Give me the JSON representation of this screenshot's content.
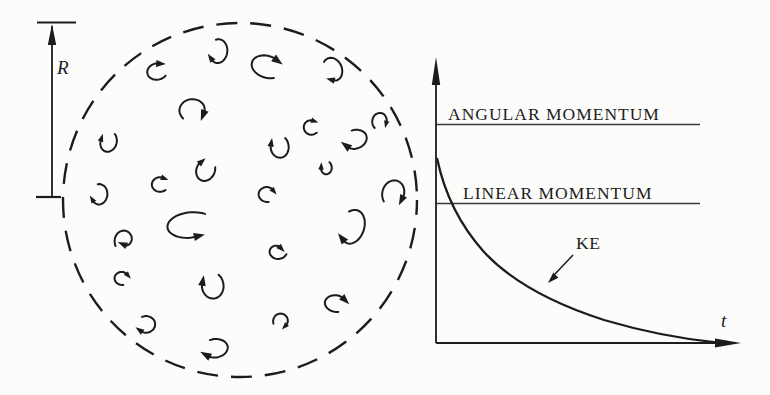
{
  "colors": {
    "ink": "#1c1c1c",
    "line": "#3a3a3a",
    "bg": "#fcfcfb"
  },
  "turbulence_panel": {
    "radius_label": "R",
    "circle": {
      "cx": 240,
      "cy": 200,
      "r": 177
    },
    "eddies": [
      {
        "x": 157,
        "y": 71,
        "rx": 11,
        "ry": 9,
        "rot": -15,
        "a0": -310,
        "a1": -60
      },
      {
        "x": 218,
        "y": 52,
        "rx": 10,
        "ry": 13,
        "rot": 10,
        "a0": -115,
        "a1": 135
      },
      {
        "x": 267,
        "y": 66,
        "rx": 17,
        "ry": 12,
        "rot": 15,
        "a0": -305,
        "a1": -55
      },
      {
        "x": 333,
        "y": 70,
        "rx": 10,
        "ry": 13,
        "rot": -20,
        "a0": -125,
        "a1": 125
      },
      {
        "x": 193,
        "y": 110,
        "rx": 14,
        "ry": 12,
        "rot": 0,
        "a0": -225,
        "a1": 25
      },
      {
        "x": 311,
        "y": 127,
        "rx": 8,
        "ry": 8,
        "rot": 0,
        "a0": -315,
        "a1": -65
      },
      {
        "x": 380,
        "y": 121,
        "rx": 8,
        "ry": 9,
        "rot": 10,
        "a0": -240,
        "a1": 10
      },
      {
        "x": 108,
        "y": 142,
        "rx": 9,
        "ry": 11,
        "rot": 15,
        "a0": -60,
        "a1": 190
      },
      {
        "x": 279,
        "y": 147,
        "rx": 10,
        "ry": 12,
        "rot": -10,
        "a0": -40,
        "a1": 210
      },
      {
        "x": 355,
        "y": 140,
        "rx": 13,
        "ry": 10,
        "rot": -20,
        "a0": -90,
        "a1": 160
      },
      {
        "x": 326,
        "y": 168,
        "rx": 6,
        "ry": 7,
        "rot": 0,
        "a0": -55,
        "a1": 190
      },
      {
        "x": 205,
        "y": 170,
        "rx": 10,
        "ry": 12,
        "rot": 20,
        "a0": -30,
        "a1": 220
      },
      {
        "x": 160,
        "y": 184,
        "rx": 9,
        "ry": 8,
        "rot": -10,
        "a0": -300,
        "a1": -50
      },
      {
        "x": 99,
        "y": 195,
        "rx": 9,
        "ry": 11,
        "rot": 10,
        "a0": -110,
        "a1": 140
      },
      {
        "x": 267,
        "y": 194,
        "rx": 9,
        "ry": 8,
        "rot": 0,
        "a0": -280,
        "a1": -30
      },
      {
        "x": 394,
        "y": 193,
        "rx": 12,
        "ry": 14,
        "rot": 15,
        "a0": -230,
        "a1": 20
      },
      {
        "x": 190,
        "y": 226,
        "rx": 25,
        "ry": 14,
        "rot": -5,
        "a0": 310,
        "a1": 70
      },
      {
        "x": 352,
        "y": 228,
        "rx": 13,
        "ry": 19,
        "rot": 20,
        "a0": -130,
        "a1": 120
      },
      {
        "x": 125,
        "y": 240,
        "rx": 11,
        "ry": 12,
        "rot": 0,
        "a0": -210,
        "a1": 110,
        "taper": 0.4
      },
      {
        "x": 277,
        "y": 251,
        "rx": 10,
        "ry": 9,
        "rot": 5,
        "a0": -345,
        "a1": -45,
        "taper": 0.5
      },
      {
        "x": 122,
        "y": 278,
        "rx": 8,
        "ry": 7,
        "rot": 0,
        "a0": -280,
        "a1": -30
      },
      {
        "x": 212,
        "y": 286,
        "rx": 12,
        "ry": 14,
        "rot": -10,
        "a0": -45,
        "a1": 210
      },
      {
        "x": 336,
        "y": 303,
        "rx": 12,
        "ry": 9,
        "rot": 5,
        "a0": -285,
        "a1": -35
      },
      {
        "x": 281,
        "y": 321,
        "rx": 8,
        "ry": 8,
        "rot": 0,
        "a0": -200,
        "a1": 50
      },
      {
        "x": 146,
        "y": 325,
        "rx": 10,
        "ry": 9,
        "rot": -15,
        "a0": -100,
        "a1": 150
      },
      {
        "x": 215,
        "y": 349,
        "rx": 14,
        "ry": 10,
        "rot": -10,
        "a0": -105,
        "a1": 145
      }
    ]
  },
  "graph_panel": {
    "angular_label": "ANGULAR MOMENTUM",
    "linear_label": "LINEAR MOMENTUM",
    "ke_label": "KE",
    "time_label": "t"
  },
  "chart_data": {
    "type": "line",
    "title": "",
    "xlabel": "t",
    "ylabel": "",
    "legend": "none",
    "grid": false,
    "series": [
      {
        "name": "ANGULAR MOMENTUM",
        "style": "constant-horizontal-line",
        "relative_level": 0.77
      },
      {
        "name": "LINEAR MOMENTUM",
        "style": "constant-horizontal-line",
        "relative_level": 0.49
      },
      {
        "name": "KE",
        "style": "exponential-decay",
        "relative_start": 0.65,
        "relative_end": 0.0
      }
    ]
  }
}
